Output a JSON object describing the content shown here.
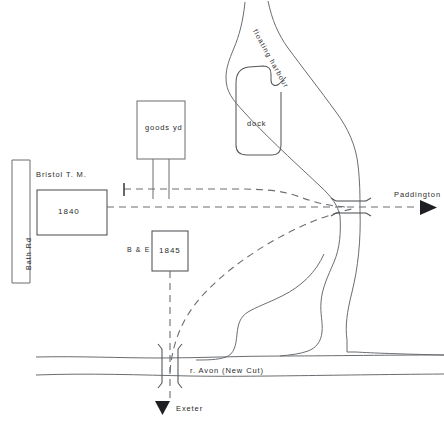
{
  "map": {
    "title": "Bristol railway and floating harbour sketch map",
    "ink_color": "#55585c",
    "text_color": "#2b2b2b",
    "background": "#ffffff",
    "labels": {
      "bath_rd": "Bath  Rd",
      "bristol_tm": "Bristol   T. M.",
      "station_1840": "1840",
      "goods_yd": "goods  yd",
      "dock": "dock",
      "floating_harbour": "floating   harbour",
      "be": "B & E",
      "station_1845": "1845",
      "paddington": "Paddington",
      "river_avon": "r.  Avon   (New  Cut)",
      "exeter": "Exeter"
    },
    "icons": {
      "arrow_right": "arrow-right-icon",
      "arrow_down": "arrow-down-icon",
      "buffer_stop": "buffer-stop-icon",
      "bridge_east": "bridge-icon",
      "bridge_south": "bridge-icon"
    }
  }
}
